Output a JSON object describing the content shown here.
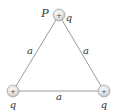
{
  "diagram": {
    "type": "equilateral-triangle-charges",
    "point_label": "P",
    "charges": [
      {
        "id": "top",
        "label": "q",
        "sign": "+"
      },
      {
        "id": "bottom-left",
        "label": "q",
        "sign": "+"
      },
      {
        "id": "bottom-right",
        "label": "q",
        "sign": "+"
      }
    ],
    "sides": [
      {
        "id": "left",
        "label": "a"
      },
      {
        "id": "right",
        "label": "a"
      },
      {
        "id": "bottom",
        "label": "a"
      }
    ],
    "colors": {
      "line": "#9a9a9a",
      "charge_fill": "#e6e6e6",
      "charge_stroke": "#a8a8a8",
      "text": "#333333"
    }
  }
}
